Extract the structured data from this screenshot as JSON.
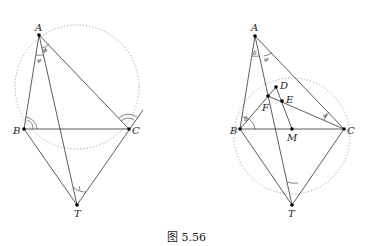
{
  "caption": "图 5.56",
  "left_figure": {
    "labels": {
      "A": "A",
      "B": "B",
      "C": "C",
      "T": "T"
    },
    "angle_marks": {
      "at_A_left": "φ",
      "at_A_right": "ϕ"
    }
  },
  "right_figure": {
    "labels": {
      "A": "A",
      "B": "B",
      "C": "C",
      "T": "T",
      "D": "D",
      "E": "E",
      "F": "F",
      "M": "M"
    },
    "angle_marks": {
      "at_A_left": "δ",
      "at_A_right": "φ",
      "at_B": "δ",
      "at_C": "φ"
    }
  }
}
